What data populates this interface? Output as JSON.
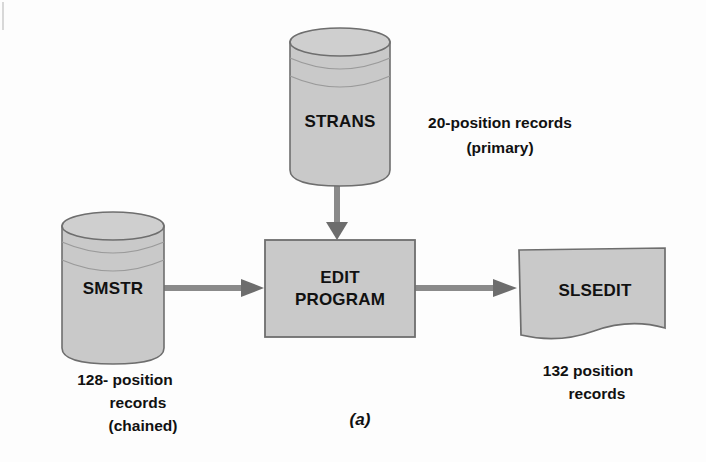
{
  "figure": {
    "caption": "(a)",
    "background_color": "#fdfdfd",
    "shape_fill": "#c9c9c9",
    "shape_stroke": "#6e6e6e",
    "arrow_color": "#8a8a8a",
    "arrow_head_color": "#6a6a6a",
    "text_color": "#111111"
  },
  "nodes": {
    "strans": {
      "label": "STRANS",
      "shape": "cylinder",
      "annotation_line1": "20-position records",
      "annotation_line2": "(primary)"
    },
    "smstr": {
      "label": "SMSTR",
      "shape": "cylinder",
      "annotation_line1": "128- position",
      "annotation_line2": "records",
      "annotation_line3": "(chained)"
    },
    "edit_program": {
      "label_line1": "EDIT",
      "label_line2": "PROGRAM",
      "shape": "process-box"
    },
    "slsedit": {
      "label": "SLSEDIT",
      "shape": "document",
      "annotation_line1": "132 position",
      "annotation_line2": "records"
    }
  },
  "arrows": [
    {
      "name": "strans-to-edit",
      "from": "strans",
      "to": "edit_program",
      "direction": "down"
    },
    {
      "name": "smstr-to-edit",
      "from": "smstr",
      "to": "edit_program",
      "direction": "right"
    },
    {
      "name": "edit-to-slsedit",
      "from": "edit_program",
      "to": "slsedit",
      "direction": "right"
    }
  ]
}
